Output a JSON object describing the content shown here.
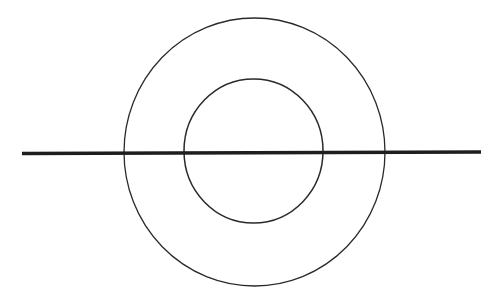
{
  "diagram": {
    "background": "#ffffff",
    "stroke_color": "#2a2a2a",
    "line_color": "#1e1e1e",
    "outer_circle": {
      "cx": 254.5,
      "cy": 152,
      "rx": 130.5,
      "ry": 134,
      "stroke_width": 1.3
    },
    "inner_circle": {
      "cx": 253.5,
      "cy": 151,
      "rx": 69.5,
      "ry": 72,
      "stroke_width": 1.5
    },
    "horizontal_line": {
      "x1": 22,
      "y1": 153.5,
      "x2": 481,
      "y2": 152,
      "stroke_width": 3.5
    }
  }
}
